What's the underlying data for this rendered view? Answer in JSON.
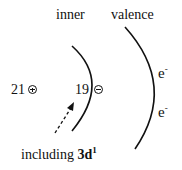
{
  "diagram": {
    "labels": {
      "inner": "inner",
      "valence": "valence",
      "nucleus_charge": "21",
      "inner_electrons": "19",
      "electron_1": "e",
      "electron_1_sup": "-",
      "electron_2": "e",
      "electron_2_sup": "-",
      "annotation_prefix": "including ",
      "annotation_orbital": "3d",
      "annotation_sup": "1"
    },
    "symbols": {
      "nucleus_sign": "plus-circle",
      "inner_sign": "minus-circle"
    },
    "colors": {
      "ink": "#111111",
      "background": "#ffffff"
    }
  }
}
